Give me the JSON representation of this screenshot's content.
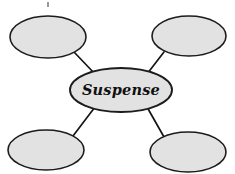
{
  "diagram": {
    "type": "concept-map",
    "background_color": "#ffffff",
    "node_fill_color": "#e2e2e2",
    "node_stroke_color": "#1c1c1c",
    "connector_color": "#151515",
    "center_node": {
      "id": "center",
      "label": "Suspense",
      "cx": 121,
      "cy": 90,
      "rx": 51,
      "ry": 22
    },
    "outer_nodes": [
      {
        "id": "top-left",
        "label": "",
        "position": "top-left",
        "cx": 48,
        "cy": 37,
        "rx": 38,
        "ry": 21
      },
      {
        "id": "top-right",
        "label": "",
        "position": "top-right",
        "cx": 189,
        "cy": 36,
        "rx": 37,
        "ry": 20
      },
      {
        "id": "bottom-left",
        "label": "",
        "position": "bottom-left",
        "cx": 46,
        "cy": 150,
        "rx": 38,
        "ry": 20
      },
      {
        "id": "bottom-right",
        "label": "",
        "position": "bottom-right",
        "cx": 188,
        "cy": 152,
        "rx": 38,
        "ry": 20
      }
    ],
    "connectors": [
      {
        "id": "center-to-top-left",
        "from": "top-left",
        "to": "center",
        "x1": 74,
        "y1": 52,
        "x2": 95,
        "y2": 74
      },
      {
        "id": "center-to-top-right",
        "from": "top-right",
        "to": "center",
        "x1": 164,
        "y1": 52,
        "x2": 147,
        "y2": 74
      },
      {
        "id": "center-to-bottom-left",
        "from": "bottom-left",
        "to": "center",
        "x1": 73,
        "y1": 136,
        "x2": 95,
        "y2": 107
      },
      {
        "id": "center-to-bottom-right",
        "from": "bottom-right",
        "to": "center",
        "x1": 164,
        "y1": 137,
        "x2": 147,
        "y2": 107
      }
    ],
    "artifacts": [
      {
        "id": "ink-speck-top",
        "x": 47,
        "y": 2,
        "width": 2,
        "height": 5
      }
    ]
  }
}
